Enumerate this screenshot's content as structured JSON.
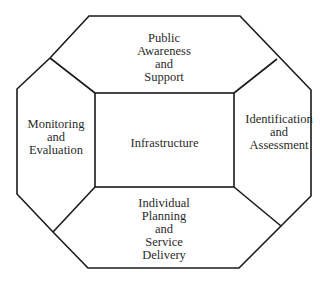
{
  "diagram": {
    "title": "",
    "center": {
      "label_lines": [
        "Infrastructure"
      ]
    },
    "segments": {
      "top": {
        "label_lines": [
          "Public",
          "Awareness",
          "and",
          "Support"
        ]
      },
      "left": {
        "label_lines": [
          "Monitoring",
          "and",
          "Evaluation"
        ]
      },
      "right": {
        "label_lines": [
          "Identification",
          "and",
          "Assessment"
        ]
      },
      "bottom": {
        "label_lines": [
          "Individual",
          "Planning",
          "and",
          "Service",
          "Delivery"
        ]
      }
    },
    "colors": {
      "line": "#1a1a1a",
      "text": "#2a2a2a",
      "background": "#ffffff"
    }
  }
}
